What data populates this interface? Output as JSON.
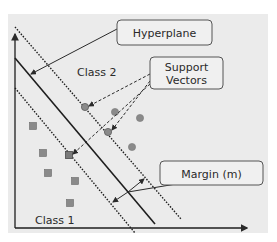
{
  "labels": {
    "class2": "Class 2",
    "class1": "Class 1",
    "hyperplane": "Hyperplane",
    "support_line1": "Support",
    "support_line2": "Vectors",
    "margin": "Margin (m)"
  },
  "colors": {
    "background": "#ebebeb",
    "page": "#ffffff",
    "line": "#1e1e1e",
    "point_fill": "#8a8a8a",
    "point_stroke": "#5a5a5a",
    "box_fill": "#f0f0f0",
    "box_stroke": "#555555"
  },
  "points": {
    "class2_circles": [
      [
        85,
        107
      ],
      [
        115,
        112
      ],
      [
        140,
        118
      ],
      [
        108,
        132
      ],
      [
        132,
        147
      ]
    ],
    "class1_squares": [
      [
        33,
        126
      ],
      [
        43,
        153
      ],
      [
        48,
        173
      ],
      [
        75,
        181
      ],
      [
        70,
        203
      ],
      [
        69,
        155
      ]
    ]
  },
  "support_vectors": [
    [
      85,
      107
    ],
    [
      108,
      132
    ],
    [
      69,
      155
    ]
  ]
}
